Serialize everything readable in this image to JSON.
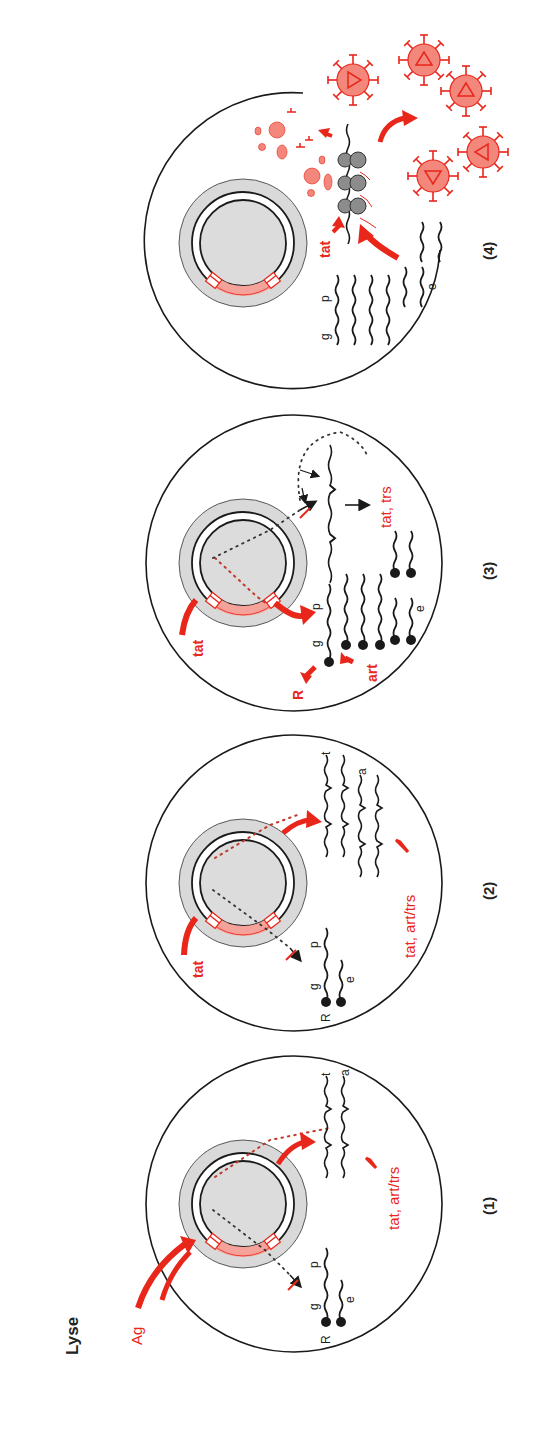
{
  "figure": {
    "title": "Lyse",
    "orientation": "rotated 90° counter-clockwise",
    "colors": {
      "accent_red": "#e8261a",
      "virion_fill": "#f4877c",
      "provirus_fill": "#f5a39a",
      "nucleus_gray": "#d9d9d9",
      "line_black": "#1a1a1a"
    },
    "input_label": "Ag",
    "panels": [
      {
        "id": "1",
        "label": "(1)",
        "stimulus": "Ag",
        "transcripts_left": {
          "R": "R",
          "g": "g",
          "p": "p",
          "e": "e"
        },
        "transcripts_right": {
          "t": "t",
          "a": "a"
        },
        "product": "tat, art/trs"
      },
      {
        "id": "2",
        "label": "(2)",
        "stimulus": "tat",
        "transcripts_left": {
          "R": "R",
          "g": "g",
          "p": "p",
          "e": "e"
        },
        "transcripts_right": {
          "t": "t",
          "a": "a"
        },
        "product": "tat, art/trs"
      },
      {
        "id": "3",
        "label": "(3)",
        "stimulus": "tat",
        "transcripts_left": {
          "g": "g",
          "p": "p",
          "e": "e"
        },
        "labels": {
          "R": "R",
          "art": "art"
        },
        "product": "tat, trs"
      },
      {
        "id": "4",
        "label": "(4)",
        "transcripts_left": {
          "g": "g",
          "p": "p",
          "e": "e"
        },
        "labels": {
          "tat": "tat"
        },
        "virion_count": 5
      }
    ]
  }
}
